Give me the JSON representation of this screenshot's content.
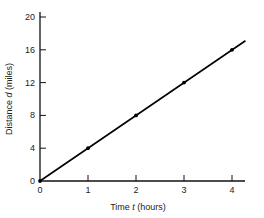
{
  "chart_data": {
    "type": "line",
    "title": "",
    "xlabel": "Time t (hours)",
    "ylabel": "Distance d (miles)",
    "xlabel_parts": {
      "prefix": "Time ",
      "var": "t",
      "suffix": " (hours)"
    },
    "ylabel_parts": {
      "prefix": "Distance ",
      "var": "d",
      "suffix": " (miles)"
    },
    "x_ticks": [
      0,
      1,
      2,
      3,
      4
    ],
    "y_ticks": [
      0,
      4,
      8,
      12,
      16,
      20
    ],
    "xlim": [
      0,
      4.3
    ],
    "ylim": [
      0,
      20
    ],
    "grid": false,
    "legend": null,
    "series": [
      {
        "name": "d = 4t",
        "x": [
          0,
          1,
          2,
          3,
          4
        ],
        "values": [
          0,
          4,
          8,
          12,
          16
        ],
        "line_extends_to": [
          4.28,
          17.1
        ],
        "markers": true,
        "color": "#000000"
      }
    ]
  }
}
